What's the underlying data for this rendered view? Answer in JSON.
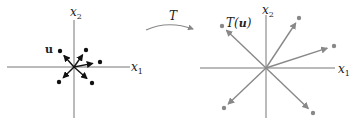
{
  "left_diagram": {
    "x_axis_label": "x",
    "x_axis_sub": "1",
    "y_axis_label": "x",
    "y_axis_sub": "2",
    "vector_label": "u",
    "vectors": [
      {
        "dx": -14,
        "dy": -16
      },
      {
        "dx": 12,
        "dy": -17
      },
      {
        "dx": 26,
        "dy": -5
      },
      {
        "dx": -15,
        "dy": 15
      },
      {
        "dx": 18,
        "dy": 16
      }
    ],
    "color": "#111111"
  },
  "transform": {
    "label": "T"
  },
  "right_diagram": {
    "x_axis_label": "x",
    "x_axis_sub": "1",
    "y_axis_label": "x",
    "y_axis_sub": "2",
    "vector_label_prefix": "T(",
    "vector_label_bold": "u",
    "vector_label_suffix": ")",
    "vectors": [
      {
        "dx": -44,
        "dy": -42
      },
      {
        "dx": 33,
        "dy": -50
      },
      {
        "dx": 68,
        "dy": -22
      },
      {
        "dx": -42,
        "dy": 40
      },
      {
        "dx": 47,
        "dy": 45
      }
    ],
    "color": "#888888"
  }
}
